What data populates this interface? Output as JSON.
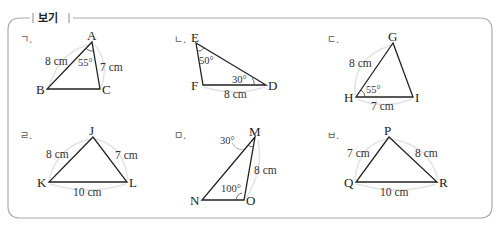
{
  "box": {
    "title": "보기",
    "border_color": "#aaaaaa"
  },
  "items": [
    {
      "label": "ㄱ.",
      "vertices": [
        "A",
        "B",
        "C"
      ],
      "sides": [
        {
          "between": [
            "A",
            "B"
          ],
          "text": "8 cm"
        },
        {
          "between": [
            "A",
            "C"
          ],
          "text": "7 cm"
        }
      ],
      "angles": [
        {
          "at": "A",
          "text": "55°"
        }
      ]
    },
    {
      "label": "ㄴ.",
      "vertices": [
        "E",
        "F",
        "D"
      ],
      "sides": [
        {
          "between": [
            "F",
            "D"
          ],
          "text": "8 cm"
        }
      ],
      "angles": [
        {
          "at": "E",
          "text": "50°"
        },
        {
          "at": "D",
          "text": "30°"
        }
      ]
    },
    {
      "label": "ㄷ.",
      "vertices": [
        "G",
        "H",
        "I"
      ],
      "sides": [
        {
          "between": [
            "G",
            "H"
          ],
          "text": "8 cm"
        },
        {
          "between": [
            "H",
            "I"
          ],
          "text": "7 cm"
        }
      ],
      "angles": [
        {
          "at": "H",
          "text": "55°"
        }
      ]
    },
    {
      "label": "ㄹ.",
      "vertices": [
        "J",
        "K",
        "L"
      ],
      "sides": [
        {
          "between": [
            "J",
            "K"
          ],
          "text": "8 cm"
        },
        {
          "between": [
            "J",
            "L"
          ],
          "text": "7 cm"
        },
        {
          "between": [
            "K",
            "L"
          ],
          "text": "10 cm"
        }
      ],
      "angles": []
    },
    {
      "label": "ㅁ.",
      "vertices": [
        "M",
        "N",
        "O"
      ],
      "sides": [
        {
          "between": [
            "M",
            "O"
          ],
          "text": "8 cm"
        }
      ],
      "angles": [
        {
          "at": "M",
          "text": "30°"
        },
        {
          "at": "O",
          "text": "100°"
        }
      ]
    },
    {
      "label": "ㅂ.",
      "vertices": [
        "P",
        "Q",
        "R"
      ],
      "sides": [
        {
          "between": [
            "P",
            "Q"
          ],
          "text": "7 cm"
        },
        {
          "between": [
            "P",
            "R"
          ],
          "text": "8 cm"
        },
        {
          "between": [
            "Q",
            "R"
          ],
          "text": "10 cm"
        }
      ],
      "angles": []
    }
  ]
}
